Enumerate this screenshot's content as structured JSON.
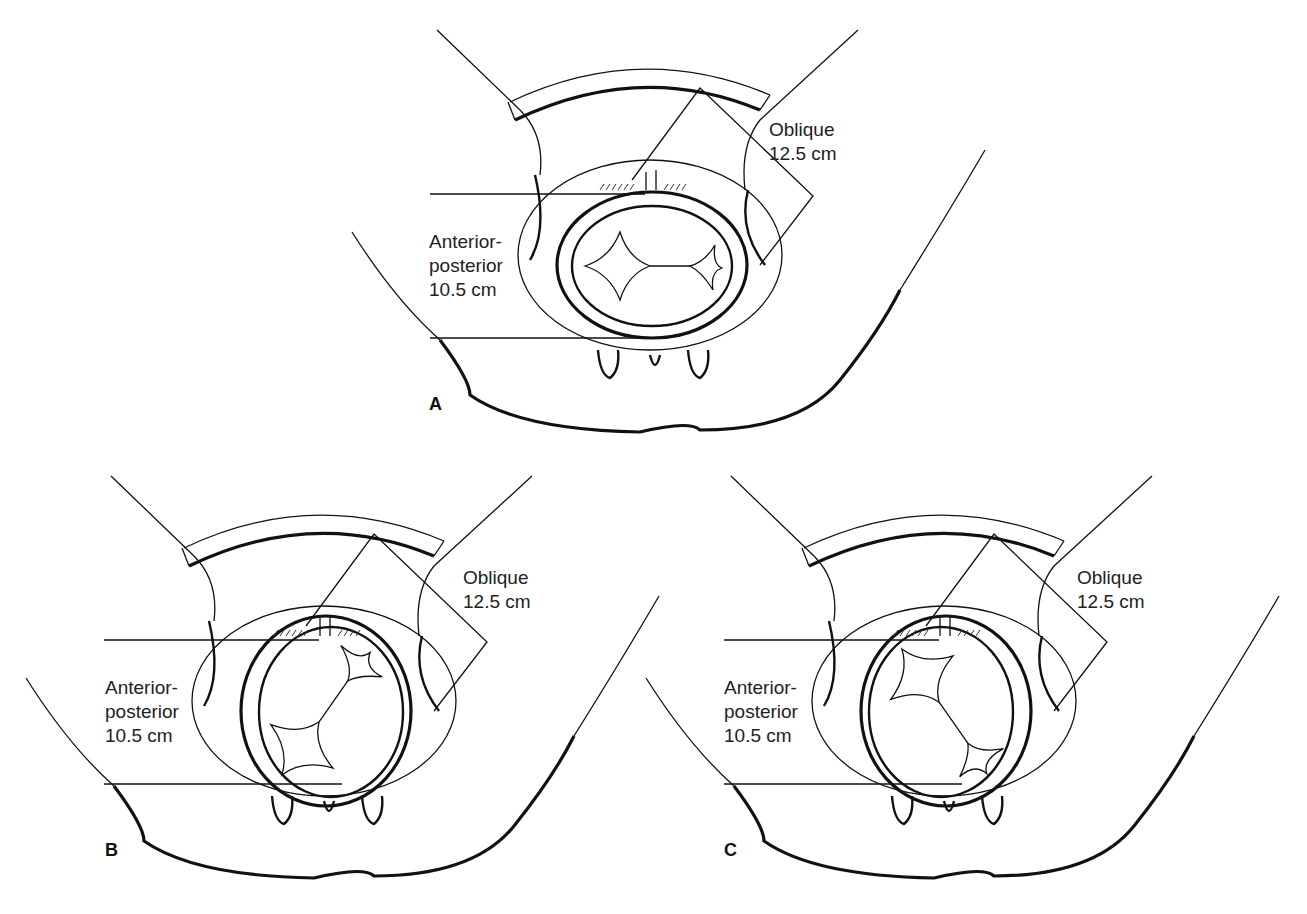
{
  "figure": {
    "panels": [
      {
        "id": "A",
        "label": "A",
        "oblique_label": "Oblique",
        "oblique_value": "12.5 cm",
        "ap_label_line1": "Anterior-",
        "ap_label_line2": "posterior",
        "ap_value": "10.5 cm",
        "head_rotation_deg": 0
      },
      {
        "id": "B",
        "label": "B",
        "oblique_label": "Oblique",
        "oblique_value": "12.5 cm",
        "ap_label_line1": "Anterior-",
        "ap_label_line2": "posterior",
        "ap_value": "10.5 cm",
        "head_rotation_deg": -45
      },
      {
        "id": "C",
        "label": "C",
        "oblique_label": "Oblique",
        "oblique_value": "12.5 cm",
        "ap_label_line1": "Anterior-",
        "ap_label_line2": "posterior",
        "ap_value": "10.5 cm",
        "head_rotation_deg": 45
      }
    ],
    "colors": {
      "line": "#111111",
      "background": "#ffffff"
    }
  }
}
